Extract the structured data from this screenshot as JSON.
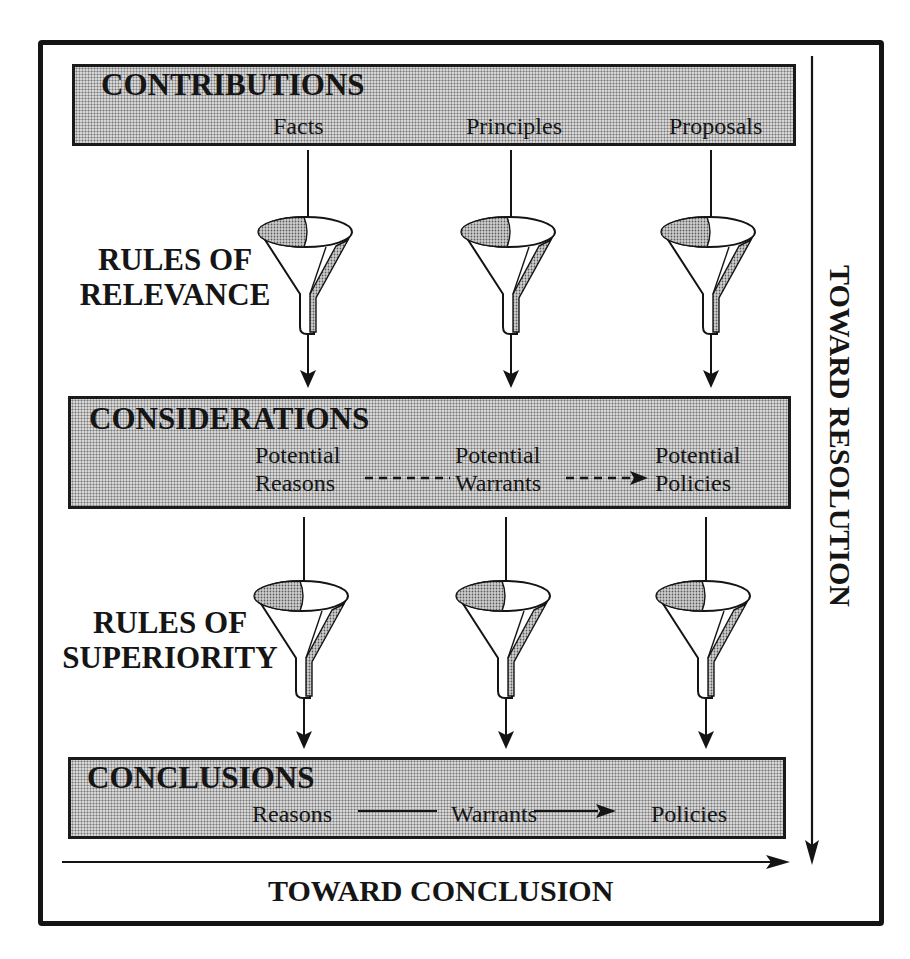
{
  "diagram": {
    "bands": {
      "contributions": {
        "title": "CONTRIBUTIONS",
        "items": [
          "Facts",
          "Principles",
          "Proposals"
        ]
      },
      "considerations": {
        "title": "CONSIDERATIONS",
        "items": [
          {
            "line1": "Potential",
            "line2": "Reasons"
          },
          {
            "line1": "Potential",
            "line2": "Warrants"
          },
          {
            "line1": "Potential",
            "line2": "Policies"
          }
        ],
        "connector_style": "dashed-arrow"
      },
      "conclusions": {
        "title": "CONCLUSIONS",
        "items": [
          "Reasons",
          "Warrants",
          "Policies"
        ],
        "connector_style": "solid-arrow"
      }
    },
    "filters": {
      "relevance": {
        "line1": "RULES OF",
        "line2": "RELEVANCE",
        "icon": "funnel-icon"
      },
      "superiority": {
        "line1": "RULES OF",
        "line2": "SUPERIORITY",
        "icon": "funnel-icon"
      }
    },
    "axes": {
      "horizontal": "TOWARD CONCLUSION",
      "vertical": "TOWARD RESOLUTION"
    },
    "colors": {
      "ink": "#141414",
      "band_fill": "#d6d6d6",
      "stipple": "#7a7a7a",
      "background": "#ffffff"
    }
  }
}
